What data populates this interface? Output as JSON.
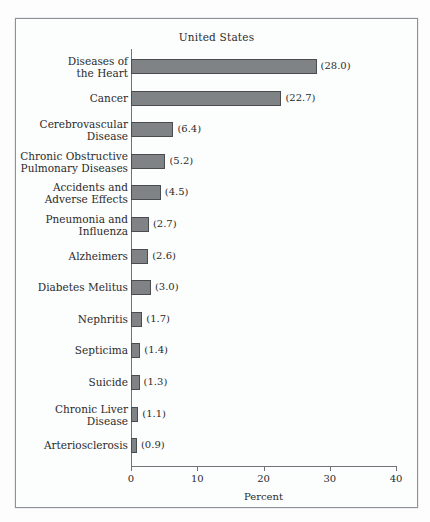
{
  "chart_data": {
    "type": "bar",
    "orientation": "horizontal",
    "title": "United States",
    "xlabel": "Percent",
    "ylabel": "",
    "xlim": [
      0,
      40
    ],
    "xticks": [
      0,
      10,
      20,
      30,
      40
    ],
    "xtick_labels": [
      "0",
      "10",
      "20",
      "30",
      "40"
    ],
    "grid": false,
    "legend": null,
    "bar_color": "#808386",
    "bar_border_color": "#4a4d50",
    "axis_color": "#6f7478",
    "frame_color": "#8d9296",
    "background": "#fcfdfd",
    "value_label_format": "(v)",
    "categories": [
      "Diseases of\nthe Heart",
      "Cancer",
      "Cerebrovascular\nDisease",
      "Chronic Obstructive\nPulmonary Diseases",
      "Accidents and\nAdverse Effects",
      "Pneumonia and\nInfluenza",
      "Alzheimers",
      "Diabetes Melitus",
      "Nephritis",
      "Septicima",
      "Suicide",
      "Chronic Liver\nDisease",
      "Arteriosclerosis"
    ],
    "values": [
      28.0,
      22.7,
      6.4,
      5.2,
      4.5,
      2.7,
      2.6,
      3.0,
      1.7,
      1.4,
      1.3,
      1.1,
      0.9
    ],
    "value_labels": [
      "(28.0)",
      "(22.7)",
      "(6.4)",
      "(5.2)",
      "(4.5)",
      "(2.7)",
      "(2.6)",
      "(3.0)",
      "(1.7)",
      "(1.4)",
      "(1.3)",
      "(1.1)",
      "(0.9)"
    ]
  }
}
